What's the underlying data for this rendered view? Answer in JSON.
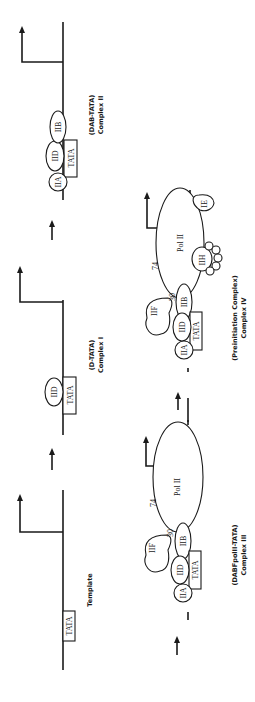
{
  "figure": {
    "orientation": "rotated-90-ccw",
    "stages": [
      {
        "caption_line1": "Template",
        "caption_line2": ""
      },
      {
        "caption_line1": "(D-TATA)",
        "caption_line2": "Complex I"
      },
      {
        "caption_line1": "(DAB-TATA)",
        "caption_line2": "Complex II"
      },
      {
        "caption_line1": "(DABFpolII-TATA)",
        "caption_line2": "Complex III"
      },
      {
        "caption_line1": "(Preinitiation Complex)",
        "caption_line2": "Complex IV"
      }
    ],
    "labels": {
      "tata": "TATA",
      "iid": "IID",
      "iia": "IIA",
      "iib": "IIB",
      "iif": "IIF",
      "f30": "30",
      "f74": "74",
      "pol2": "Pol II",
      "iie": "IE",
      "iih": "IIH"
    }
  }
}
